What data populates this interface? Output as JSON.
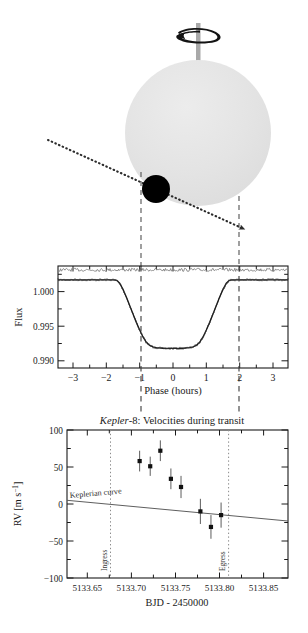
{
  "figure": {
    "panels": [
      "transit-geometry-diagram",
      "flux-lightcurve-plot",
      "radial-velocity-plot"
    ]
  },
  "diagram": {
    "name": "transit-geometry-diagram",
    "star_label": "star-disk",
    "planet_label": "transiting-planet",
    "spin_axis_label": "stellar-spin-axis",
    "spin_arrow_label": "rotation-direction-arrow",
    "orbit_path_label": "planet-orbit-track",
    "ingress_guide_label": "ingress-guide-line",
    "egress_guide_label": "egress-guide-line",
    "colors": {
      "star_fill": "#e3e3e3",
      "planet_fill": "#000000",
      "axis_fill": "#aaaaaa",
      "path_stroke": "#2b2b2b",
      "guide_stroke": "#444444"
    }
  },
  "flux_plot": {
    "ylabel": "Flux",
    "xlabel": "Phase (hours)",
    "yticks": [
      "1.000",
      "0.995",
      "0.990"
    ],
    "ytick_values": [
      1.0,
      0.995,
      0.99
    ],
    "xticks": [
      "−3",
      "−2",
      "−1",
      "0",
      "1",
      "2",
      "3"
    ],
    "xtick_values": [
      -3,
      -2,
      -1,
      0,
      1,
      2,
      3
    ],
    "xlim": [
      -3.45,
      3.45
    ],
    "ylim": [
      0.9885,
      1.0018
    ],
    "ingress_phase": -1.73,
    "egress_phase": 1.73,
    "residual_offset": 1.0013,
    "grid": false
  },
  "rv_plot": {
    "title_italic": "Kepler",
    "title_rest": "-8: Velocities during transit",
    "ylabel": "RV [m s−1]",
    "ylabel_plain": "RV [m s",
    "ylabel_exp": "−1",
    "ylabel_tail": "]",
    "xlabel": "BJD - 2450000",
    "yticks": [
      "100",
      "50",
      "0",
      "−50",
      "−100"
    ],
    "ytick_values": [
      100,
      50,
      0,
      -50,
      -100
    ],
    "xticks": [
      "5133.65",
      "5133.70",
      "5133.75",
      "5133.80",
      "5133.85"
    ],
    "xtick_values": [
      5133.65,
      5133.7,
      5133.75,
      5133.8,
      5133.85
    ],
    "xlim": [
      5133.627,
      5133.878
    ],
    "ylim": [
      -100,
      100
    ],
    "curve_label": "Keplerian curve",
    "ingress_label": "Ingress",
    "egress_label": "Egress",
    "ingress_x": 5133.699,
    "egress_x": 5133.833,
    "keplerian_curve": {
      "x": [
        5133.627,
        5133.878
      ],
      "y": [
        5,
        -23
      ]
    },
    "grid": false
  },
  "chart_data": [
    {
      "type": "line",
      "name": "flux-lightcurve-plot",
      "title": "",
      "xlabel": "Phase (hours)",
      "ylabel": "Flux",
      "xlim": [
        -3.45,
        3.45
      ],
      "ylim": [
        0.9885,
        1.0018
      ],
      "xticks": [
        -3,
        -2,
        -1,
        0,
        1,
        2,
        3
      ],
      "yticks": [
        1.0,
        0.995,
        0.99
      ],
      "grid": false,
      "annotations": [
        {
          "label": "ingress",
          "x": -1.73,
          "style": "dashed-vertical"
        },
        {
          "label": "egress",
          "x": 1.73,
          "style": "dashed-vertical"
        }
      ],
      "series": [
        {
          "name": "transit light curve",
          "x": [
            -3.45,
            -3.2,
            -3.0,
            -2.8,
            -2.6,
            -2.4,
            -2.2,
            -2.0,
            -1.9,
            -1.8,
            -1.73,
            -1.68,
            -1.6,
            -1.5,
            -1.4,
            -1.3,
            -1.2,
            -1.1,
            -1.0,
            -0.9,
            -0.8,
            -0.7,
            -0.6,
            -0.5,
            -0.3,
            -0.1,
            0.1,
            0.3,
            0.5,
            0.6,
            0.7,
            0.8,
            0.9,
            1.0,
            1.1,
            1.2,
            1.3,
            1.4,
            1.5,
            1.6,
            1.68,
            1.73,
            1.8,
            1.9,
            2.0,
            2.2,
            2.4,
            2.6,
            2.8,
            3.0,
            3.2,
            3.45
          ],
          "y": [
            1.0,
            1.0,
            1.0,
            1.0,
            1.0,
            1.0,
            1.0,
            1.0,
            1.0,
            1.0,
            0.99995,
            0.9999,
            0.99955,
            0.99875,
            0.99775,
            0.99665,
            0.99555,
            0.99445,
            0.99345,
            0.99255,
            0.99185,
            0.99145,
            0.99125,
            0.99115,
            0.99105,
            0.99105,
            0.99105,
            0.99108,
            0.99115,
            0.99125,
            0.99145,
            0.99185,
            0.99255,
            0.99345,
            0.99445,
            0.99555,
            0.99665,
            0.99775,
            0.99875,
            0.99955,
            0.9999,
            0.99995,
            1.0,
            1.0,
            1.0,
            1.0,
            1.0,
            1.0,
            1.0,
            1.0,
            1.0,
            1.0
          ]
        },
        {
          "name": "residuals (offset)",
          "offset": 1.0013,
          "scatter_amplitude": 0.00018
        }
      ]
    },
    {
      "type": "scatter",
      "name": "radial-velocity-plot",
      "title": "Kepler-8: Velocities during transit",
      "xlabel": "BJD - 2450000",
      "ylabel": "RV [m s−1]",
      "xlim": [
        5133.627,
        5133.878
      ],
      "ylim": [
        -100,
        100
      ],
      "xticks": [
        5133.65,
        5133.7,
        5133.75,
        5133.8,
        5133.85
      ],
      "yticks": [
        100,
        50,
        0,
        -50,
        -100
      ],
      "grid": false,
      "annotations": [
        {
          "label": "Ingress",
          "x": 5133.699,
          "style": "dotted-vertical"
        },
        {
          "label": "Egress",
          "x": 5133.833,
          "style": "dotted-vertical"
        },
        {
          "label": "Keplerian curve",
          "x": 5133.66,
          "y": 14,
          "style": "text"
        }
      ],
      "series": [
        {
          "name": "measured radial velocities",
          "x": [
            5133.7095,
            5133.7215,
            5133.733,
            5133.745,
            5133.7565,
            5133.7785,
            5133.7905,
            5133.802
          ],
          "y": [
            58,
            51,
            72,
            34,
            23,
            -10,
            -31,
            -15
          ],
          "yerr": [
            14,
            13,
            14,
            14,
            15,
            17,
            16,
            17
          ]
        },
        {
          "name": "Keplerian curve",
          "type": "line",
          "x": [
            5133.627,
            5133.878
          ],
          "y": [
            5,
            -23
          ]
        }
      ]
    }
  ]
}
